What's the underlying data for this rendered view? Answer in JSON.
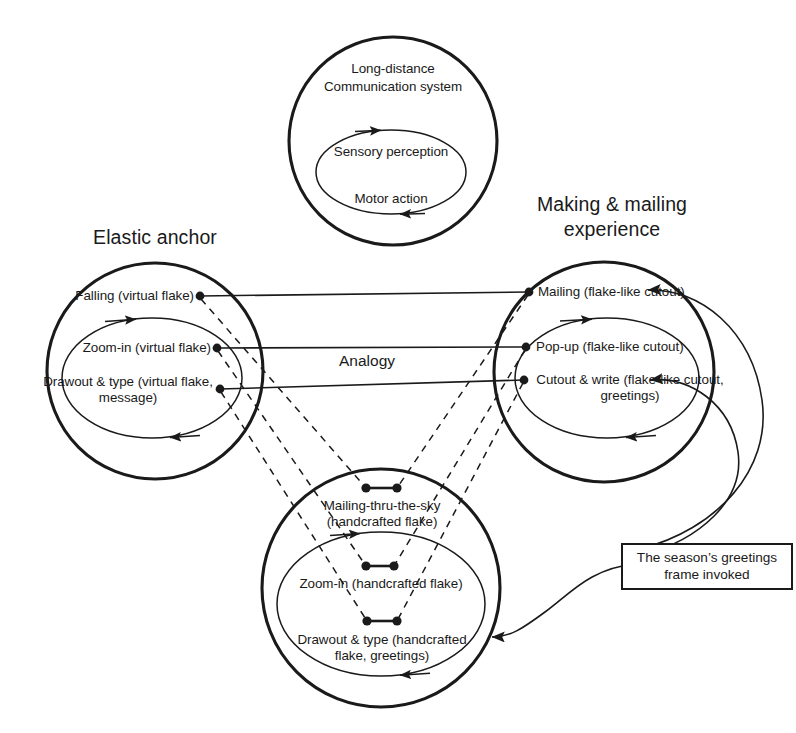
{
  "diagram": {
    "kind": "conceptual-blending-analogy-diagram",
    "center_label": "Analogy",
    "colors": {
      "stroke": "#1a1a1a",
      "text": "#1a1a1a",
      "background": "#ffffff"
    }
  },
  "top_space": {
    "title_line1": "Long-distance",
    "title_line2": "Communication system",
    "inner": {
      "item1": "Sensory perception",
      "item2": "Motor action"
    }
  },
  "left_space": {
    "title": "Elastic anchor",
    "nodes": [
      {
        "label": "Falling (virtual flake)"
      },
      {
        "label": "Zoom-in (virtual flake)"
      },
      {
        "label": "Drawout & type (virtual flake,\nmessage)"
      }
    ]
  },
  "right_space": {
    "title_line1": "Making & mailing",
    "title_line2": "experience",
    "nodes": [
      {
        "label": "Mailing (flake-like cutout)"
      },
      {
        "label": "Pop-up (flake-like cutout)"
      },
      {
        "label": "Cutout & write (flake-like cutout,\ngreetings)"
      }
    ]
  },
  "bottom_space": {
    "nodes": [
      {
        "label": "Mailing-thru-the-sky\n(handcrafted flake)"
      },
      {
        "label": "Zoom-in (handcrafted flake)"
      },
      {
        "label": "Drawout & type (handcrafted\nflake, greetings)"
      }
    ]
  },
  "callout": {
    "text": "The season’s greetings\nframe invoked"
  }
}
